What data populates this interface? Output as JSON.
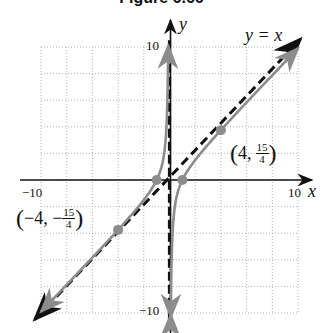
{
  "title": "Figure 6.66",
  "chart_data": {
    "type": "line",
    "title": "Figure 6.66",
    "function": "f(x) = x - 1/x",
    "xlabel": "x",
    "ylabel": "y",
    "xlim": [
      -10,
      10
    ],
    "ylim": [
      -10,
      10
    ],
    "grid": true,
    "grid_step": 2,
    "x_tick_labels": [
      "-10",
      "10"
    ],
    "y_tick_labels": [
      "10",
      "-10"
    ],
    "asymptotes": [
      {
        "type": "vertical",
        "equation": "x = 0",
        "style": "dashed"
      },
      {
        "type": "oblique",
        "equation": "y = x",
        "label": "y = x",
        "style": "dashed"
      }
    ],
    "series": [
      {
        "name": "left-branch",
        "color": "#8c8c8c",
        "x": [
          -10,
          -8,
          -6,
          -4,
          -3,
          -2,
          -1,
          -0.5,
          -0.25,
          -0.1
        ],
        "y": [
          -9.9,
          -7.875,
          -5.833,
          -3.75,
          -2.667,
          -1.5,
          0,
          1.5,
          3.75,
          9.9
        ]
      },
      {
        "name": "right-branch",
        "color": "#8c8c8c",
        "x": [
          0.1,
          0.25,
          0.5,
          1,
          2,
          3,
          4,
          6,
          8,
          10
        ],
        "y": [
          -9.9,
          -3.75,
          -1.5,
          0,
          1.5,
          2.667,
          3.75,
          5.833,
          7.875,
          9.9
        ]
      }
    ],
    "points": [
      {
        "x": 4,
        "y": 3.75,
        "label": "(4, 15/4)"
      },
      {
        "x": -4,
        "y": -3.75,
        "label": "(-4, -15/4)"
      },
      {
        "x": -1,
        "y": 0,
        "label": ""
      },
      {
        "x": 1,
        "y": 0,
        "label": ""
      }
    ]
  },
  "labels": {
    "x_axis": "x",
    "y_axis": "y",
    "x_min": "−10",
    "x_max": "10",
    "y_max": "10",
    "y_min": "−10",
    "asymptote": "y = x",
    "point_pos": {
      "open": "(",
      "a": "4,",
      "num": "15",
      "den": "4",
      "close": ")"
    },
    "point_neg": {
      "open": "(",
      "a": "−4, −",
      "num": "15",
      "den": "4",
      "close": ")"
    }
  },
  "colors": {
    "curve": "#8c8c8c",
    "axis": "#111111",
    "grid": "#b5b5b5",
    "point": "#8c8c8c"
  }
}
